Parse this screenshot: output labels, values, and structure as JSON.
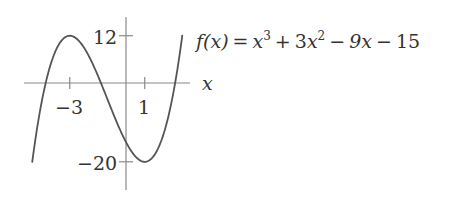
{
  "chart_data": {
    "type": "line",
    "title": "",
    "function_label": "f(x) = x^3 + 3x^2 - 9x - 15",
    "formula_parts": {
      "lhs": "f(x)",
      "eq": "=",
      "t1_base": "x",
      "t1_exp": "3",
      "op1": "+",
      "t2_coef": "3",
      "t2_base": "x",
      "t2_exp": "2",
      "op2": "−",
      "t3": "9x",
      "op3": "−",
      "t4": "15"
    },
    "xlabel": "x",
    "ylabel": "",
    "x_ticks": [
      {
        "value": -3,
        "label": "−3"
      },
      {
        "value": 1,
        "label": "1"
      }
    ],
    "y_ticks": [
      {
        "value": 12,
        "label": "12"
      },
      {
        "value": -20,
        "label": "−20"
      }
    ],
    "xlim": [
      -5,
      3
    ],
    "ylim": [
      -20,
      12
    ],
    "grid": false,
    "legend": "none",
    "series": [
      {
        "name": "f(x)",
        "x": [
          -5,
          -4.5,
          -4,
          -3.5,
          -3,
          -2.5,
          -2,
          -1.5,
          -1,
          -0.5,
          0,
          0.5,
          1,
          1.5,
          2,
          2.5,
          3
        ],
        "values": [
          -20,
          -3.375,
          5,
          10.125,
          12,
          10.625,
          7,
          1.125,
          -4,
          -10.125,
          -15,
          -18.875,
          -20,
          -16.875,
          -7,
          9.375,
          12
        ]
      }
    ],
    "extrema": [
      {
        "x": -3,
        "y": 12,
        "kind": "local max"
      },
      {
        "x": 1,
        "y": -20,
        "kind": "local min"
      }
    ],
    "line_color": "#555555",
    "axis_color": "#888888"
  }
}
